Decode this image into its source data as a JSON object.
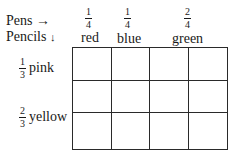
{
  "header": {
    "pens_label": "Pens",
    "pens_arrow": "→",
    "pencils_label": "Pencils",
    "pencils_arrow": "↓"
  },
  "columns": [
    {
      "fraction": {
        "num": "1",
        "den": "4"
      },
      "color": "red"
    },
    {
      "fraction": {
        "num": "1",
        "den": "4"
      },
      "color": "blue"
    },
    {
      "fraction": {
        "num": "2",
        "den": "4"
      },
      "color": "green"
    }
  ],
  "rows": [
    {
      "fraction": {
        "num": "1",
        "den": "3"
      },
      "color": "pink"
    },
    {
      "fraction": {
        "num": "2",
        "den": "3"
      },
      "color": "yellow"
    }
  ],
  "grid": {
    "columns": 4,
    "rows": 3,
    "line_color": "#2a2a2a"
  }
}
